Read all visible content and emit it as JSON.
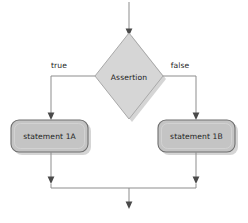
{
  "diagram": {
    "type": "flowchart",
    "colors": {
      "background": "#ffffff",
      "diamond_fill": "#d6d6d6",
      "diamond_stroke": "#a9a9a9",
      "box_fill": "#c4c4c4",
      "box_stroke": "#6f6f6f",
      "connector": "#8d8d8d",
      "arrow_head": "#4a4a4a",
      "text": "#232323"
    },
    "nodes": [
      {
        "id": "decision",
        "shape": "diamond",
        "label": "Assertion"
      },
      {
        "id": "statement-true",
        "shape": "rounded-rectangle",
        "label": "statement 1A"
      },
      {
        "id": "statement-false",
        "shape": "rounded-rectangle",
        "label": "statement 1B"
      }
    ],
    "edge_labels": {
      "true_branch": "true",
      "false_branch": "false"
    },
    "edges": [
      {
        "id": "entry",
        "from": "start",
        "to": "decision",
        "label": ""
      },
      {
        "id": "true-edge",
        "from": "decision",
        "to": "statement-true",
        "label": "true"
      },
      {
        "id": "false-edge",
        "from": "decision",
        "to": "statement-false",
        "label": "false"
      },
      {
        "id": "true-merge",
        "from": "statement-true",
        "to": "merge",
        "label": ""
      },
      {
        "id": "false-merge",
        "from": "statement-false",
        "to": "merge",
        "label": ""
      },
      {
        "id": "exit",
        "from": "merge",
        "to": "end",
        "label": ""
      }
    ]
  }
}
